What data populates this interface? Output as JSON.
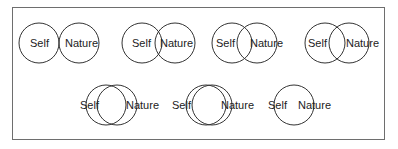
{
  "figure": {
    "stroke_color": "#333333",
    "frame_color": "#6e6e6e",
    "circle_radius": 20,
    "items": [
      {
        "id": 1,
        "self_label": "Self",
        "nature_label": "Nature",
        "self_cx": 39,
        "nature_cx": 79,
        "cy": 43,
        "self_text_x": 30,
        "nature_text_x": 65
      },
      {
        "id": 2,
        "self_label": "Self",
        "nature_label": "Nature",
        "self_cx": 142,
        "nature_cx": 175,
        "cy": 43,
        "self_text_x": 132,
        "nature_text_x": 160
      },
      {
        "id": 3,
        "self_label": "Self",
        "nature_label": "Nature",
        "self_cx": 232,
        "nature_cx": 257,
        "cy": 43,
        "self_text_x": 216,
        "nature_text_x": 250
      },
      {
        "id": 4,
        "self_label": "Self",
        "nature_label": "Nature",
        "self_cx": 325,
        "nature_cx": 349,
        "cy": 43,
        "self_text_x": 308,
        "nature_text_x": 346
      },
      {
        "id": 5,
        "self_label": "Self",
        "nature_label": "Nature",
        "self_cx": 106,
        "nature_cx": 117,
        "cy": 105,
        "self_text_x": 80,
        "nature_text_x": 126
      },
      {
        "id": 6,
        "self_label": "Self",
        "nature_label": "Nature",
        "self_cx": 206,
        "nature_cx": 212,
        "cy": 105,
        "self_text_x": 172,
        "nature_text_x": 221
      },
      {
        "id": 7,
        "self_label": "Self",
        "nature_label": "Nature",
        "self_cx": 294,
        "nature_cx": 294,
        "cy": 105,
        "self_text_x": 268,
        "nature_text_x": 298
      }
    ]
  }
}
